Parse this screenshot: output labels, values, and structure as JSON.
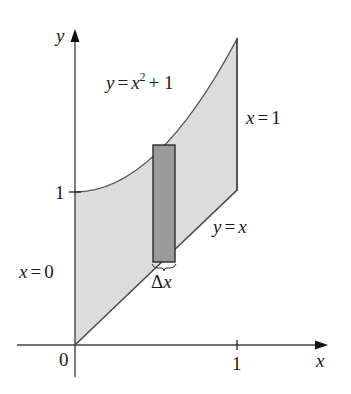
{
  "figure": {
    "axes": {
      "x_label": "x",
      "y_label": "y",
      "origin_label": "0",
      "x_tick_label": "1",
      "y_tick_label": "1"
    },
    "curves": {
      "upper": {
        "lhs": "y",
        "eq": "=",
        "var": "x",
        "exp": "2",
        "rest": "+ 1"
      },
      "lower": {
        "text_lhs": "y",
        "eq": "=",
        "rhs": "x"
      },
      "left_bound": {
        "lhs": "x",
        "eq": "=",
        "rhs": "0"
      },
      "right_bound": {
        "lhs": "x",
        "eq": "=",
        "rhs": "1"
      }
    },
    "strip": {
      "label_delta": "Δ",
      "label_var": "x"
    },
    "colors": {
      "region_fill": "#dcdcdc",
      "strip_fill": "#9a9a9a",
      "line": "#3a3a3a"
    }
  }
}
